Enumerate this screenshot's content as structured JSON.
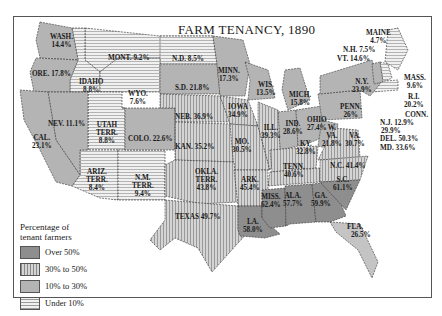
{
  "title": "FARM TENANCY, 1890",
  "legend": {
    "title_line1": "Percentage of",
    "title_line2": "tenant farmers",
    "items": [
      {
        "label": "Over 50%",
        "pattern": "solid-dark",
        "color": "#8c8c8c"
      },
      {
        "label": "30% to 50%",
        "pattern": "vertical-lines",
        "color": "#b9b9b9"
      },
      {
        "label": "10% to 30%",
        "pattern": "solid-light",
        "color": "#b0b0b0"
      },
      {
        "label": "Under 10%",
        "pattern": "horizontal-lines",
        "color": "#e4e4e4"
      }
    ]
  },
  "states": {
    "wash": {
      "name": "WASH.",
      "value": "14.4%"
    },
    "ore": {
      "name": "ORE.",
      "value": "17.8%"
    },
    "idaho": {
      "name": "IDAHO",
      "value": "8.8%"
    },
    "mont": {
      "name": "MONT.",
      "value": "9.2%"
    },
    "wyo": {
      "name": "WYO.",
      "value": "7.6%"
    },
    "nd": {
      "name": "N.D.",
      "value": "8.5%"
    },
    "sd": {
      "name": "S.D.",
      "value": "21.8%"
    },
    "minn": {
      "name": "MINN.",
      "value": "17.3%"
    },
    "wis": {
      "name": "WIS.",
      "value": "13.5%"
    },
    "mich": {
      "name": "MICH.",
      "value": "15.8%"
    },
    "nev": {
      "name": "NEV.",
      "value": "11.1%"
    },
    "cal": {
      "name": "CAL.",
      "value": "23.1%"
    },
    "utah": {
      "name": "UTAH TERR.",
      "line1": "UTAH",
      "line2": "TERR.",
      "value": "8.8%"
    },
    "colo": {
      "name": "COLO.",
      "value": "22.6%"
    },
    "neb": {
      "name": "NEB.",
      "value": "36.9%"
    },
    "iowa": {
      "name": "IOWA",
      "value": "34.9%"
    },
    "ill": {
      "name": "ILL.",
      "value": "39.3%"
    },
    "ind": {
      "name": "IND.",
      "value": "28.6%"
    },
    "ohio": {
      "name": "OHIO",
      "value": "27.4%"
    },
    "kan": {
      "name": "KAN.",
      "value": "35.2%"
    },
    "mo": {
      "name": "MO.",
      "value": "30.5%"
    },
    "ky": {
      "name": "KY.",
      "value": "32.8%"
    },
    "wva": {
      "name": "W. VA.",
      "line1": "W.",
      "line2": "VA.",
      "value": "21.8%"
    },
    "va": {
      "name": "VA.",
      "value": "30.7%"
    },
    "ariz": {
      "name": "ARIZ. TERR.",
      "line1": "ARIZ.",
      "line2": "TERR.",
      "value": "8.4%"
    },
    "nm": {
      "name": "N.M. TERR.",
      "line1": "N.M.",
      "line2": "TERR.",
      "value": "9.4%"
    },
    "okla": {
      "name": "OKLA. TERR.",
      "line1": "OKLA.",
      "line2": "TERR.",
      "value": "43.8%"
    },
    "ark": {
      "name": "ARK.",
      "value": "45.4%"
    },
    "tenn": {
      "name": "TENN.",
      "value": "40.6%"
    },
    "nc": {
      "name": "N.C.",
      "value": "41.4%"
    },
    "sc": {
      "name": "S.C.",
      "value": "61.1%"
    },
    "texas": {
      "name": "TEXAS",
      "value": "49.7%"
    },
    "la": {
      "name": "LA.",
      "value": "58.0%"
    },
    "miss": {
      "name": "MISS.",
      "value": "62.4%"
    },
    "ala": {
      "name": "ALA.",
      "value": "57.7%"
    },
    "ga": {
      "name": "GA.",
      "value": "59.9%"
    },
    "fla": {
      "name": "FLA.",
      "value": "26.5%"
    },
    "ny": {
      "name": "N.Y.",
      "value": "23.9%"
    },
    "penn": {
      "name": "PENN.",
      "value": "26%"
    },
    "maine": {
      "name": "MAINE",
      "value": "4.7%"
    },
    "nh": {
      "name": "N.H.",
      "value": "7.5%"
    },
    "vt": {
      "name": "VT.",
      "value": "14.6%"
    },
    "mass": {
      "name": "MASS.",
      "value": "9.6%"
    },
    "ri": {
      "name": "R.I.",
      "value": "20.2%"
    },
    "conn": {
      "name": "CONN.",
      "value": "29.9%"
    },
    "nj": {
      "name": "N.J.",
      "value": "12.9%"
    },
    "del": {
      "name": "DEL.",
      "value": "50.3%"
    },
    "md": {
      "name": "MD.",
      "value": "33.6%"
    }
  }
}
